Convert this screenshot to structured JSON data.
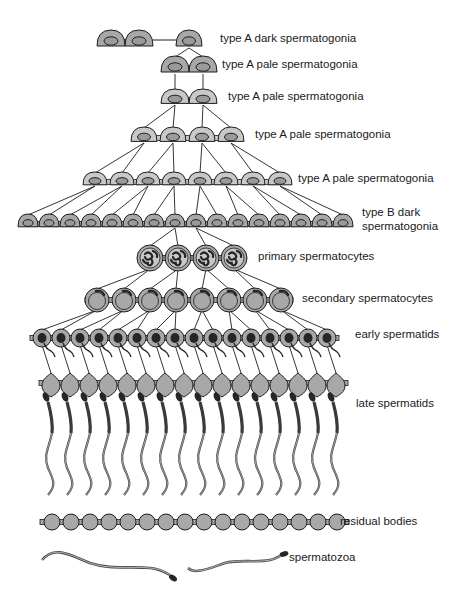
{
  "colors": {
    "line": "#1e1e1e",
    "cell_fill": "#a8a8a8",
    "cell_pale_fill": "#c8c8c8",
    "nucleus_fill": "#9a9a9a",
    "dark_fill": "#262626",
    "background": "#ffffff"
  },
  "labels": [
    {
      "id": "a-dark",
      "text": "type A dark spermatogonia",
      "x": 220,
      "y": 33
    },
    {
      "id": "a-pale-1",
      "text": "type A pale spermatogonia",
      "x": 222,
      "y": 59
    },
    {
      "id": "a-pale-2",
      "text": "type A pale spermatogonia",
      "x": 228,
      "y": 91
    },
    {
      "id": "a-pale-3",
      "text": "type A pale spermatogonia",
      "x": 255,
      "y": 129
    },
    {
      "id": "a-pale-4",
      "text": "type A pale spermatogonia",
      "x": 298,
      "y": 173
    },
    {
      "id": "b-dark",
      "text": "type B dark spermatogonia",
      "x": 362,
      "y": 207,
      "two_line": true
    },
    {
      "id": "primary",
      "text": "primary spermatocytes",
      "x": 258,
      "y": 251
    },
    {
      "id": "secondary",
      "text": "secondary spermatocytes",
      "x": 302,
      "y": 293
    },
    {
      "id": "early",
      "text": "early spermatids",
      "x": 355,
      "y": 329
    },
    {
      "id": "late",
      "text": "late spermatids",
      "x": 356,
      "y": 398
    },
    {
      "id": "residual",
      "text": "residual bodies",
      "x": 340,
      "y": 516
    },
    {
      "id": "spermatozoa",
      "text": "spermatozoa",
      "x": 289,
      "y": 552
    }
  ],
  "rows": [
    {
      "id": "a-dark-pair",
      "type": "dome",
      "y": 40,
      "rx": 14,
      "ry": 10,
      "xs": [
        111,
        139
      ],
      "bridge": true,
      "fill": "dark"
    },
    {
      "id": "a-dark-single",
      "type": "dome",
      "y": 40,
      "rx": 13,
      "ry": 10,
      "xs": [
        189
      ],
      "fill": "dark"
    },
    {
      "id": "a-pale-2cells",
      "type": "dome",
      "y": 66,
      "rx": 14,
      "ry": 10,
      "xs": [
        175,
        203
      ],
      "bridge": true,
      "fill": "dark"
    },
    {
      "id": "a-pale-2cells-b",
      "type": "dome",
      "y": 98,
      "rx": 14,
      "ry": 9,
      "xs": [
        175,
        203
      ],
      "bridge": true,
      "fill": "pale"
    },
    {
      "id": "a-pale-4cells",
      "type": "dome",
      "y": 136,
      "rx": 13,
      "ry": 9,
      "xs": [
        144,
        173,
        202,
        231
      ],
      "bridge": true,
      "fill": "pale"
    },
    {
      "id": "a-pale-8cells",
      "type": "dome",
      "y": 180,
      "rx": 12,
      "ry": 8,
      "xs": [
        95,
        122,
        148,
        174,
        200,
        226,
        253,
        280
      ],
      "bridge": true,
      "fill": "pale"
    },
    {
      "id": "b-dark-16cells",
      "type": "dome",
      "y": 222,
      "rx": 10,
      "ry": 8,
      "xs": [
        28,
        49,
        70,
        91,
        112,
        133,
        154,
        175,
        196,
        217,
        238,
        259,
        280,
        301,
        322,
        343
      ],
      "bridge": true,
      "fill": "dark"
    },
    {
      "id": "primary-spermatocytes",
      "type": "primary",
      "y": 258,
      "r": 13,
      "xs": [
        150,
        178,
        206,
        234
      ],
      "bridge": true
    },
    {
      "id": "secondary-spermatocytes",
      "type": "secondary",
      "y": 300,
      "r": 12,
      "xs": [
        97,
        124,
        150,
        176,
        202,
        229,
        255,
        281
      ],
      "bridge": true
    },
    {
      "id": "early-spermatids",
      "type": "early",
      "y": 338,
      "r": 9,
      "xs": [
        42,
        61,
        80,
        99,
        118,
        137,
        156,
        175,
        194,
        213,
        232,
        251,
        270,
        289,
        308,
        327
      ],
      "bridge": true
    },
    {
      "id": "late-spermatids",
      "type": "late",
      "y": 383,
      "r": 9,
      "xs": [
        51,
        70,
        89,
        108,
        127,
        146,
        165,
        184,
        203,
        222,
        241,
        260,
        279,
        298,
        317,
        336
      ],
      "bridge": true
    },
    {
      "id": "residual-bodies",
      "type": "residual",
      "y": 522,
      "r": 8,
      "xs": [
        52,
        71,
        90,
        109,
        128,
        147,
        166,
        185,
        204,
        223,
        242,
        261,
        280,
        299,
        318,
        337
      ],
      "bridge": true
    }
  ],
  "links": [
    {
      "from_row": 1,
      "to_row": 2,
      "map": [
        [
          0,
          0
        ],
        [
          0,
          1
        ]
      ]
    },
    {
      "from_row": 2,
      "to_row": 3,
      "map": [
        [
          0,
          0
        ],
        [
          1,
          1
        ]
      ]
    },
    {
      "from_row": 3,
      "to_row": 4,
      "map": [
        [
          0,
          0
        ],
        [
          0,
          1
        ],
        [
          1,
          2
        ],
        [
          1,
          3
        ]
      ]
    },
    {
      "from_row": 4,
      "to_row": 5,
      "map": [
        [
          0,
          0
        ],
        [
          0,
          1
        ],
        [
          1,
          2
        ],
        [
          1,
          3
        ],
        [
          2,
          4
        ],
        [
          2,
          5
        ],
        [
          3,
          6
        ],
        [
          3,
          7
        ]
      ]
    },
    {
      "from_row": 5,
      "to_row": 6,
      "map": [
        [
          0,
          0
        ],
        [
          0,
          1
        ],
        [
          1,
          2
        ],
        [
          1,
          3
        ],
        [
          2,
          4
        ],
        [
          2,
          5
        ],
        [
          3,
          6
        ],
        [
          3,
          7
        ],
        [
          4,
          8
        ],
        [
          4,
          9
        ],
        [
          5,
          10
        ],
        [
          5,
          11
        ],
        [
          6,
          12
        ],
        [
          6,
          13
        ],
        [
          7,
          14
        ],
        [
          7,
          15
        ]
      ]
    },
    {
      "from_row": 6,
      "to_row": 7,
      "map": [
        [
          7,
          0
        ],
        [
          7,
          1
        ],
        [
          8,
          2
        ],
        [
          8,
          3
        ]
      ]
    },
    {
      "from_row": 7,
      "to_row": 8,
      "map": [
        [
          0,
          0
        ],
        [
          0,
          1
        ],
        [
          1,
          2
        ],
        [
          1,
          3
        ],
        [
          2,
          4
        ],
        [
          2,
          5
        ],
        [
          3,
          6
        ],
        [
          3,
          7
        ]
      ]
    },
    {
      "from_row": 8,
      "to_row": 9,
      "map": [
        [
          0,
          0
        ],
        [
          0,
          1
        ],
        [
          1,
          2
        ],
        [
          1,
          3
        ],
        [
          2,
          4
        ],
        [
          2,
          5
        ],
        [
          3,
          6
        ],
        [
          3,
          7
        ],
        [
          4,
          8
        ],
        [
          4,
          9
        ],
        [
          5,
          10
        ],
        [
          5,
          11
        ],
        [
          6,
          12
        ],
        [
          6,
          13
        ],
        [
          7,
          14
        ],
        [
          7,
          15
        ]
      ]
    },
    {
      "from_row": 9,
      "to_row": 10,
      "map": [
        [
          0,
          0
        ],
        [
          1,
          1
        ],
        [
          2,
          2
        ],
        [
          3,
          3
        ],
        [
          4,
          4
        ],
        [
          5,
          5
        ],
        [
          6,
          6
        ],
        [
          7,
          7
        ],
        [
          8,
          8
        ],
        [
          9,
          9
        ],
        [
          10,
          10
        ],
        [
          11,
          11
        ],
        [
          12,
          12
        ],
        [
          13,
          13
        ],
        [
          14,
          14
        ],
        [
          15,
          15
        ]
      ]
    }
  ],
  "a_dark_connector": {
    "x1": 153,
    "x2": 176,
    "y": 40
  },
  "spermatozoa": [
    {
      "id": "spermatozoon-left",
      "path": "M42 560 C55 545 70 555 90 563 C110 570 130 566 150 568 C160 569 165 572 170 575",
      "head": [
        173,
        578
      ],
      "head_angle": 35
    },
    {
      "id": "spermatozoon-right",
      "path": "M188 568 C195 575 210 568 225 563 C240 559 255 563 270 560 C275 559 278 557 280 556",
      "head": [
        284,
        554
      ],
      "head_angle": -15
    }
  ]
}
